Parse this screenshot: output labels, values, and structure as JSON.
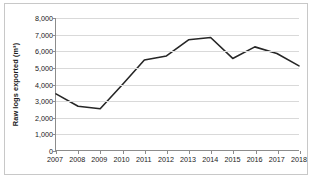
{
  "chart_data": {
    "type": "line",
    "title": "",
    "subtitle": "",
    "xlabel": "",
    "ylabel": "Raw logs exported (m³)",
    "categories": [
      "2007",
      "2008",
      "2009",
      "2010",
      "2011",
      "2012",
      "2013",
      "2014",
      "2015",
      "2016",
      "2017",
      "2018"
    ],
    "x": [
      2007,
      2008,
      2009,
      2010,
      2011,
      2012,
      2013,
      2014,
      2015,
      2016,
      2017,
      2018
    ],
    "values": [
      3400,
      2650,
      2500,
      3950,
      5450,
      5700,
      6680,
      6820,
      5550,
      6250,
      5850,
      5100
    ],
    "series": [
      {
        "name": "Raw logs exported",
        "values": [
          3400,
          2650,
          2500,
          3950,
          5450,
          5700,
          6680,
          6820,
          5550,
          6250,
          5850,
          5100
        ],
        "color": "#262626"
      }
    ],
    "ylim": [
      0,
      8000
    ],
    "ytick_values": [
      0,
      1000,
      2000,
      3000,
      4000,
      5000,
      6000,
      7000,
      8000
    ],
    "ytick_labels": [
      "0",
      "1,000",
      "2,000",
      "3,000",
      "4,000",
      "5,000",
      "6,000",
      "7,000",
      "8,000"
    ],
    "xtick_labels": [
      "2007",
      "2008",
      "2009",
      "2010",
      "2011",
      "2012",
      "2013",
      "2014",
      "2015",
      "2016",
      "2017",
      "2018"
    ],
    "grid": "horizontal",
    "grid_color": "#d9d9d9",
    "legend": "none",
    "legend_position": "none",
    "axis_color": "#8c8c8c",
    "line_color": "#262626",
    "border_color": "#c8c8c8",
    "background_color": "#ffffff",
    "markers": "none",
    "annotations": []
  }
}
